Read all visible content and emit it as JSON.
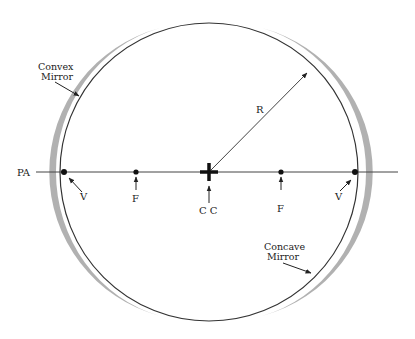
{
  "diagram": {
    "type": "spherical-mirror-geometry",
    "labels": {
      "principal_axis": "PA",
      "convex_mirror_line1": "Convex",
      "convex_mirror_line2": "Mirror",
      "concave_mirror_line1": "Concave",
      "concave_mirror_line2": "Mirror",
      "radius": "R",
      "vertex_left": "V",
      "vertex_right": "V",
      "focus_left": "F",
      "focus_right": "F",
      "center_of_curvature": "C C"
    },
    "colors": {
      "line": "#333333",
      "mirror_fill": "#a8a8a8",
      "background": "#ffffff"
    }
  }
}
